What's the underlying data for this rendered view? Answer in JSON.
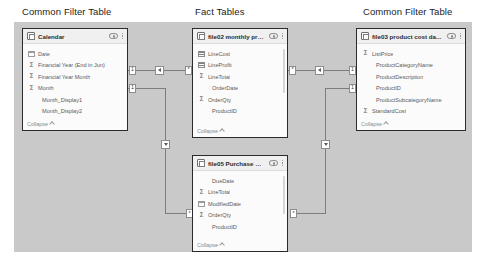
{
  "view": {
    "name": "power-bi-model-view",
    "canvas_background": "#c9c9c9"
  },
  "section_titles": {
    "left": "Common Filter Table",
    "center": "Fact Tables",
    "right": "Common Filter Table"
  },
  "footer_label": "Collapse",
  "tables": [
    {
      "id": "calendar",
      "title": "Calendar",
      "icon": "table-icon",
      "header_icons": [
        "eye-icon",
        "kebab-menu-icon"
      ],
      "fields": [
        {
          "name": "Date",
          "icon": "calendar-icon"
        },
        {
          "name": "Financial Year (End in Jun)",
          "icon": "sigma-icon"
        },
        {
          "name": "Financial Year Month",
          "icon": "sigma-icon"
        },
        {
          "name": "Month",
          "icon": "sigma-icon"
        },
        {
          "name": "Month_Display1",
          "icon": "none"
        },
        {
          "name": "Month_Display2",
          "icon": "none"
        }
      ]
    },
    {
      "id": "file02",
      "title": "file02 monthly produ...",
      "icon": "table-icon",
      "header_icons": [
        "eye-icon",
        "kebab-menu-icon"
      ],
      "fields": [
        {
          "name": "LineCost",
          "icon": "measure-icon"
        },
        {
          "name": "LineProfit",
          "icon": "measure-icon"
        },
        {
          "name": "LineTotal",
          "icon": "sigma-icon"
        },
        {
          "name": "OrderDate",
          "icon": "none"
        },
        {
          "name": "OrderQty",
          "icon": "sigma-icon"
        },
        {
          "name": "ProductID",
          "icon": "none"
        }
      ]
    },
    {
      "id": "file05",
      "title": "file05 Purchase Order",
      "icon": "table-icon",
      "header_icons": [
        "eye-icon",
        "kebab-menu-icon"
      ],
      "fields": [
        {
          "name": "DueDate",
          "icon": "none"
        },
        {
          "name": "LineTotal",
          "icon": "sigma-icon"
        },
        {
          "name": "ModifiedDate",
          "icon": "calendar-icon"
        },
        {
          "name": "OrderQty",
          "icon": "sigma-icon"
        },
        {
          "name": "ProductID",
          "icon": "none"
        }
      ]
    },
    {
      "id": "file03",
      "title": "file03 product cost da...",
      "icon": "table-icon",
      "header_icons": [
        "eye-icon",
        "kebab-menu-icon"
      ],
      "fields": [
        {
          "name": "ListPrice",
          "icon": "sigma-icon"
        },
        {
          "name": "ProductCategoryName",
          "icon": "none"
        },
        {
          "name": "ProductDescription",
          "icon": "none"
        },
        {
          "name": "ProductID",
          "icon": "none"
        },
        {
          "name": "ProductSubcategoryName",
          "icon": "none"
        },
        {
          "name": "StandardCost",
          "icon": "sigma-icon"
        }
      ]
    }
  ],
  "relationships": [
    {
      "id": "cal-file02",
      "from": "calendar",
      "to": "file02",
      "from_cardinality": "1",
      "to_cardinality": "*",
      "cross_filter": "single"
    },
    {
      "id": "cal-file05",
      "from": "calendar",
      "to": "file05",
      "from_cardinality": "1",
      "to_cardinality": "*",
      "cross_filter": "single"
    },
    {
      "id": "file02-file03",
      "from": "file03",
      "to": "file02",
      "from_cardinality": "1",
      "to_cardinality": "*",
      "cross_filter": "single"
    },
    {
      "id": "file05-file03",
      "from": "file03",
      "to": "file05",
      "from_cardinality": "1",
      "to_cardinality": "*",
      "cross_filter": "single"
    }
  ]
}
